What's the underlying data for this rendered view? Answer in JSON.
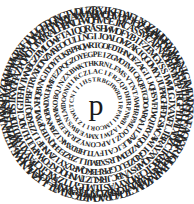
{
  "figure": {
    "kind": "circular-letter-ring-puzzle",
    "background_color": "#ffffff",
    "letter_color": "#262626",
    "center_letter_color": "#1a1a1a",
    "width": 194,
    "height": 204,
    "center_x": 96,
    "center_y": 104,
    "outer_radius": 90
  },
  "center": {
    "label": "p",
    "description": "lowercase serif p at the middle of the rings"
  },
  "rings": [
    {
      "index": 0,
      "radius": 24,
      "font_size": 6.2,
      "start_angle": -94,
      "text": "TRBGHWRDIRPMIIMCORIIZYWUTCNIIIHS"
    },
    {
      "index": 1,
      "radius": 32,
      "font_size": 6.8,
      "start_angle": -100,
      "text": "LACIFRZQPDHRPNWBIAZWIXMVEBWSNLMDOONHIKCZ"
    },
    {
      "index": 2,
      "radius": 40,
      "font_size": 7.4,
      "start_angle": -97,
      "text": "HKRNLFMSVTNTAWHRPMLOQZIAPCONYZRAEEHOMKOBQJNZXBWKT"
    },
    {
      "index": 3,
      "radius": 49,
      "font_size": 8.0,
      "start_angle": -102,
      "text": "EGPEIZGMOTMICKQBTGDOARQAJLZMLEJCAIFVTLHBDXWKIZRWNOBWDXUHMFEZPQGZOY"
    },
    {
      "index": 4,
      "radius": 58,
      "font_size": 8.6,
      "start_angle": -99,
      "text": "WRTGOFDTHNOFZAGIIJQHSVFLWQIRYTQOVZEDWLRSXBMJLLZBZEEHQNTEQPXMLXHQBVNGJDOYFUKBPRQ"
    },
    {
      "index": 5,
      "radius": 67,
      "font_size": 9.2,
      "start_angle": -103,
      "text": "LNGIJOALOMZAKIQGOMYYJUPRGHFDGSWCAWIIGRDZEUCGPRFBKQWRYXYIZMNHFIJZEKBQJPBFTRVXHONZMAEOCUL"
    },
    {
      "index": 6,
      "radius": 75,
      "font_size": 9.7,
      "start_angle": -100,
      "text": "QRASHWMOFYBIFZEMGYSSIWMLGJXAXFLJBRAYXNQWBSVNBCJRKUZTMNHQCKFOYWPULHJADCIGTEHVIWNBGZPMLOWFTAIQ"
    },
    {
      "index": 7,
      "radius": 83,
      "font_size": 10.2,
      "start_angle": -97,
      "text": "WQHVUEJKCASSMCAPNXOBPMYUPJRGFIDMIXQZCIKBBGTCFMQXYVASTLMLGYTTZAXGTCPAYXLWYDJDFBSIKXGHAZPQWOIJMVRAUHBNLF"
    },
    {
      "index": 8,
      "radius": 89,
      "font_size": 10.6,
      "start_angle": -101,
      "text": "WMARWQHVUEJOZAHDRYYWFORSYVNTLMGUCGIDHBCJTPLRWSVBMNIGKDZQXHPRAWNFCIGKTJOYVPAMZBLEQXSHVDRNUTCMIGJOBZFLWKPYA"
    },
    {
      "index": 9,
      "radius": 93,
      "font_size": 10.9,
      "start_angle": -104,
      "text": "VDUZBXIKFDAEUXQZAHDRYYWFNIGIMIYDSKNFAQXXRJQLBWPMZHVCTGKQRAOWBTGSLWTLIJZMLNHWEJFTINJWMKPYZGKHAPKPXFIVUCEDOXGT"
    },
    {
      "index": 10,
      "radius": 86,
      "font_size": 8.2,
      "start_angle": -90,
      "text": "ZPCPHGKVHFBGPNMNGIM"
    }
  ],
  "alphabet_note": "uppercase Latin letters arranged on concentric circles"
}
